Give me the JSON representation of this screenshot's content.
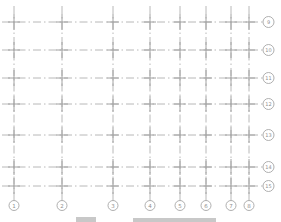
{
  "drawing": {
    "type": "structural-axis-grid-plan",
    "background": "#ffffff",
    "line_color": "#b8b8b8",
    "intersection_color": "#a2a2a2",
    "bubble_stroke_color": "#a6a6a6",
    "label_color": "#8f8f8f",
    "caption_color": "#c8c8c8",
    "column_axes": [
      {
        "label": "1",
        "x": 14
      },
      {
        "label": "2",
        "x": 62
      },
      {
        "label": "3",
        "x": 113
      },
      {
        "label": "4",
        "x": 150
      },
      {
        "label": "5",
        "x": 180
      },
      {
        "label": "6",
        "x": 206
      },
      {
        "label": "7",
        "x": 231
      },
      {
        "label": "8",
        "x": 249
      }
    ],
    "row_axes": [
      {
        "label": "9",
        "y": 22
      },
      {
        "label": "10",
        "y": 50
      },
      {
        "label": "11",
        "y": 78
      },
      {
        "label": "12",
        "y": 104
      },
      {
        "label": "13",
        "y": 135
      },
      {
        "label": "14",
        "y": 167
      },
      {
        "label": "15",
        "y": 186
      }
    ],
    "geometry": {
      "v_line_top": 6,
      "v_line_bottom": 200,
      "h_line_left": 2,
      "h_line_right": 263,
      "col_bubble_cy": 205.5,
      "col_bubble_r": 5,
      "row_bubble_cx": 268.5,
      "row_bubble_r": 5.5,
      "cross_half_v": 8,
      "cross_half_h": 6,
      "dash_pattern": "8 3 1.5 3"
    },
    "caption_fragments": [
      {
        "x": 76,
        "y": 217,
        "w": 20,
        "h": 5
      },
      {
        "x": 133,
        "y": 218,
        "w": 83,
        "h": 4
      }
    ]
  }
}
